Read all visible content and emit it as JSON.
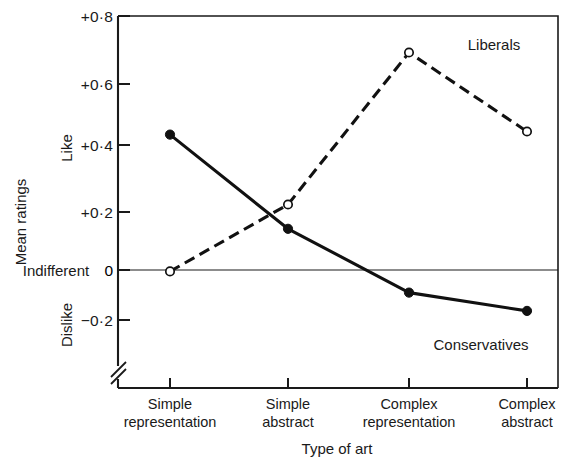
{
  "chart_data": {
    "type": "line",
    "title": "",
    "xlabel": "Type of art",
    "ylabel": "Mean ratings",
    "categories": [
      "Simple representation",
      "Simple abstract",
      "Complex representation",
      "Complex abstract"
    ],
    "category_lines": [
      [
        "Simple",
        "representation"
      ],
      [
        "Simple",
        "abstract"
      ],
      [
        "Complex",
        "representation"
      ],
      [
        "Complex",
        "abstract"
      ]
    ],
    "series": [
      {
        "name": "Conservatives",
        "values": [
          0.41,
          0.1,
          -0.11,
          -0.17
        ],
        "marker": "filled-circle",
        "linestyle": "solid"
      },
      {
        "name": "Liberals",
        "values": [
          -0.04,
          0.18,
          0.68,
          0.42
        ],
        "marker": "open-circle",
        "linestyle": "dashed"
      }
    ],
    "ylim": [
      -0.26,
      0.8
    ],
    "yticks": [
      0.8,
      0.6,
      0.4,
      0.2,
      0,
      -0.2
    ],
    "ytick_labels": [
      "+0·8",
      "+0·6",
      "+0·4",
      "+0·2",
      "0",
      "−0·2"
    ],
    "y_axis_scale_labels": {
      "high": "Like",
      "zero": "Indifferent",
      "low": "Dislike"
    },
    "axis_break": true,
    "grid": false,
    "legend_position": "inline-annotations",
    "annotations": [
      {
        "text": "Liberals",
        "x_px": 494,
        "y_px": 50
      },
      {
        "text": "Conservatives",
        "x_px": 481,
        "y_px": 350
      }
    ],
    "colors": {
      "ink": "#111111",
      "background": "#ffffff"
    }
  }
}
